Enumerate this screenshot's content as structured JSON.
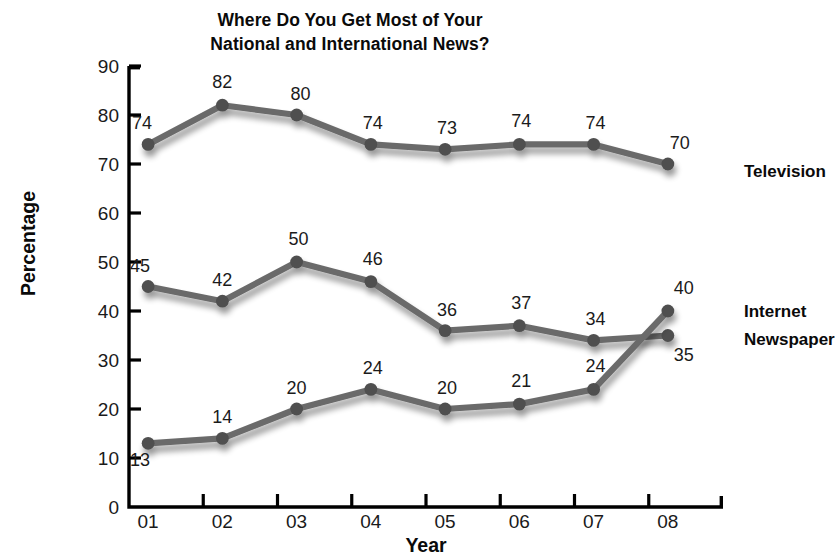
{
  "chart_data": {
    "type": "line",
    "title": "Where Do You Get Most of Your National and International News?",
    "title_lines": [
      "Where Do You Get Most of Your",
      "National and International News?"
    ],
    "xlabel": "Year",
    "ylabel": "Percentage",
    "categories": [
      "01",
      "02",
      "03",
      "04",
      "05",
      "06",
      "07",
      "08"
    ],
    "ylim": [
      0,
      90
    ],
    "yticks": [
      0,
      10,
      20,
      30,
      40,
      50,
      60,
      70,
      80,
      90
    ],
    "grid": false,
    "legend_position": "right-inline",
    "series": [
      {
        "name": "Television",
        "values": [
          74,
          82,
          80,
          74,
          73,
          74,
          74,
          70
        ],
        "color": "#6b6b6b"
      },
      {
        "name": "Newspaper",
        "values": [
          45,
          42,
          50,
          46,
          36,
          37,
          34,
          35
        ],
        "color": "#6b6b6b"
      },
      {
        "name": "Internet",
        "values": [
          13,
          14,
          20,
          24,
          20,
          21,
          24,
          40
        ],
        "color": "#6b6b6b"
      }
    ],
    "colors": {
      "line": "#6b6b6b",
      "marker": "#4f4f4f",
      "axis": "#000000",
      "text": "#111111",
      "background": "#ffffff"
    }
  }
}
